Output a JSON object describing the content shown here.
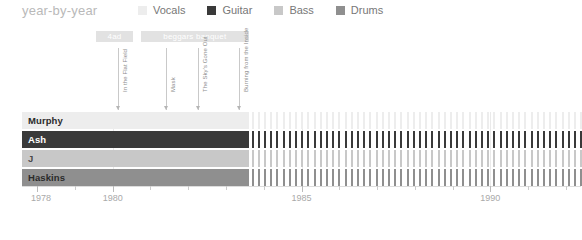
{
  "header": {
    "title": "year-by-year"
  },
  "legend": {
    "items": [
      {
        "label": "Vocals",
        "color": "#ededed"
      },
      {
        "label": "Guitar",
        "color": "#3a3a3a"
      },
      {
        "label": "Bass",
        "color": "#c8c8c8"
      },
      {
        "label": "Drums",
        "color": "#8f8f8f"
      }
    ]
  },
  "eras": [
    {
      "label": "4ad",
      "start": 1979.55,
      "end": 1980.55
    },
    {
      "label": "beggars banquet",
      "start": 1980.75,
      "end": 1983.6
    }
  ],
  "albums": [
    {
      "label": "In the Flat Field",
      "year": 1980.15
    },
    {
      "label": "Mask",
      "year": 1981.4
    },
    {
      "label": "The Sky's Gone Out",
      "year": 1982.25
    },
    {
      "label": "Burning from the Inside",
      "year": 1983.35
    }
  ],
  "members": [
    {
      "name": "Murphy",
      "role": "Vocals",
      "color": "#ededed",
      "label_color": "#2b2b2b",
      "solid_end": 1983.6,
      "dashed_end": 1992.4
    },
    {
      "name": "Ash",
      "role": "Guitar",
      "color": "#3a3a3a",
      "label_color": "#ffffff",
      "solid_end": 1983.6,
      "dashed_end": 1992.4
    },
    {
      "name": "J",
      "role": "Bass",
      "color": "#c8c8c8",
      "label_color": "#4a4a4a",
      "solid_end": 1983.6,
      "dashed_end": 1992.4
    },
    {
      "name": "Haskins",
      "role": "Drums",
      "color": "#8f8f8f",
      "label_color": "#2b2b2b",
      "solid_end": 1983.6,
      "dashed_end": 1992.4
    }
  ],
  "axis": {
    "min": 1977.6,
    "max": 1992.4,
    "labels": [
      {
        "text": "1978",
        "year": 1978
      },
      {
        "text": "1980",
        "year": 1980
      },
      {
        "text": "1985",
        "year": 1985
      },
      {
        "text": "1990",
        "year": 1990
      }
    ],
    "minor_tick_step": 1
  },
  "chart_data": {
    "type": "bar",
    "title": "year-by-year",
    "xlabel": "",
    "ylabel": "",
    "xlim": [
      1977.6,
      1992.4
    ],
    "grid": true,
    "legend_position": "top-right",
    "categories": [
      "Murphy",
      "Ash",
      "J",
      "Haskins"
    ],
    "series": [
      {
        "name": "Vocals",
        "member": "Murphy",
        "color": "#ededed",
        "active_start": 1977.6,
        "active_end": 1983.6,
        "dashed_start": 1983.6,
        "dashed_end": 1992.4
      },
      {
        "name": "Guitar",
        "member": "Ash",
        "color": "#3a3a3a",
        "active_start": 1977.6,
        "active_end": 1983.6,
        "dashed_start": 1983.6,
        "dashed_end": 1992.4
      },
      {
        "name": "Bass",
        "member": "J",
        "color": "#c8c8c8",
        "active_start": 1977.6,
        "active_end": 1983.6,
        "dashed_start": 1983.6,
        "dashed_end": 1992.4
      },
      {
        "name": "Drums",
        "member": "Haskins",
        "color": "#8f8f8f",
        "active_start": 1977.6,
        "active_end": 1983.6,
        "dashed_start": 1983.6,
        "dashed_end": 1992.4
      }
    ],
    "annotations": [
      {
        "type": "era",
        "label": "4ad",
        "start": 1979.55,
        "end": 1980.55
      },
      {
        "type": "era",
        "label": "beggars banquet",
        "start": 1980.75,
        "end": 1983.6
      },
      {
        "type": "album",
        "label": "In the Flat Field",
        "year": 1980.15
      },
      {
        "type": "album",
        "label": "Mask",
        "year": 1981.4
      },
      {
        "type": "album",
        "label": "The Sky's Gone Out",
        "year": 1982.25
      },
      {
        "type": "album",
        "label": "Burning from the Inside",
        "year": 1983.35
      }
    ],
    "xticks": [
      1978,
      1980,
      1985,
      1990
    ]
  }
}
